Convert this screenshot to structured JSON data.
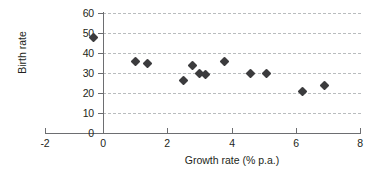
{
  "chart_data": {
    "type": "scatter",
    "title": "",
    "xlabel": "Growth rate (% p.a.)",
    "ylabel": "Birth rate",
    "xlim": [
      -2,
      8
    ],
    "ylim": [
      0,
      60
    ],
    "xticks": [
      "-2",
      "0",
      "2",
      "4",
      "6",
      "8"
    ],
    "xtick_values": [
      -2,
      0,
      2,
      4,
      6,
      8
    ],
    "yticks": [
      "0",
      "10",
      "20",
      "30",
      "40",
      "50",
      "60"
    ],
    "ytick_values": [
      0,
      10,
      20,
      30,
      40,
      50,
      60
    ],
    "grid": "horizontal-dashed",
    "legend": "none",
    "marker": "diamond",
    "marker_color": "#3b3b3d",
    "points": [
      {
        "x": -0.3,
        "y": 48
      },
      {
        "x": 1.0,
        "y": 35.8
      },
      {
        "x": 1.4,
        "y": 35
      },
      {
        "x": 2.5,
        "y": 26.5
      },
      {
        "x": 2.8,
        "y": 34
      },
      {
        "x": 3.0,
        "y": 29.8
      },
      {
        "x": 3.2,
        "y": 29.3
      },
      {
        "x": 3.8,
        "y": 36
      },
      {
        "x": 4.6,
        "y": 30
      },
      {
        "x": 5.1,
        "y": 30
      },
      {
        "x": 6.2,
        "y": 21
      },
      {
        "x": 6.9,
        "y": 24
      }
    ]
  }
}
